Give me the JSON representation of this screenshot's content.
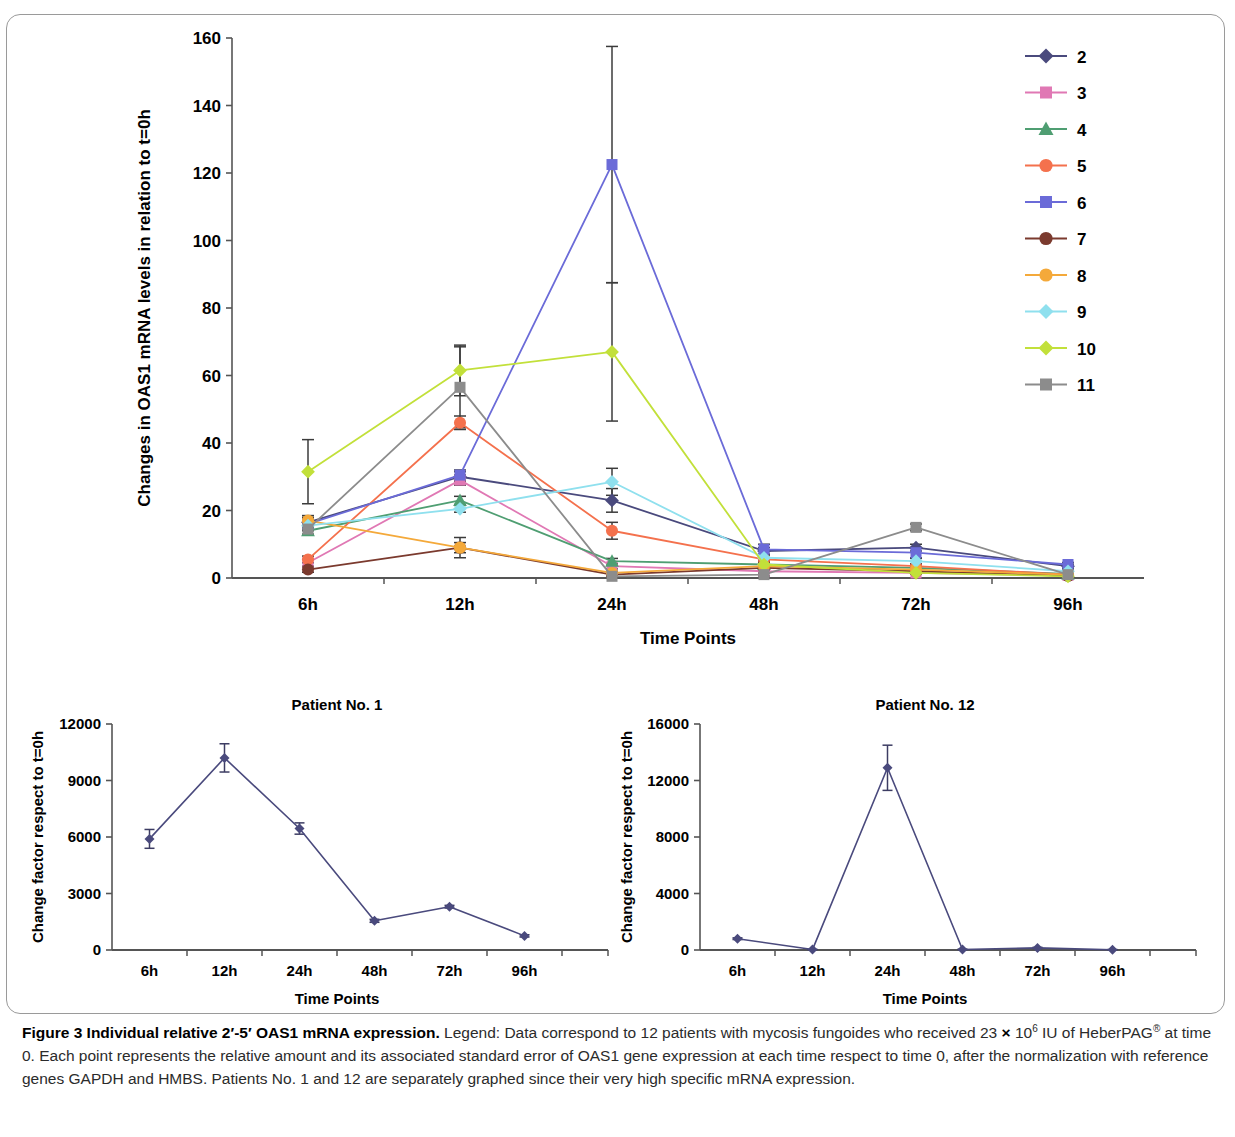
{
  "figure": {
    "caption_bold": "Figure 3 Individual relative 2′-5′ OAS1 mRNA expression.",
    "caption_rest_a": " Legend: Data correspond to 12 patients with mycosis fungoides who received 23 ",
    "caption_rest_b": " 10",
    "caption_exp": "6",
    "caption_rest_c": " IU of HeberPAG",
    "caption_reg": "®",
    "caption_rest_d": " at time 0. Each point represents the relative amount and its associated standard error of OAS1 gene expression at each time respect to time 0, after the normalization with reference genes GAPDH and HMBS. Patients No. 1 and 12 are separately graphed since their very high specific mRNA expression.",
    "times_symbol": "×"
  },
  "chart_data": [
    {
      "id": "main",
      "type": "line",
      "title": "",
      "xlabel": "Time Points",
      "ylabel": "Changes in OAS1 mRNA levels in relation to t=0h",
      "categories": [
        "6h",
        "12h",
        "24h",
        "48h",
        "72h",
        "96h"
      ],
      "ylim": [
        0,
        160
      ],
      "yticks": [
        0,
        20,
        40,
        60,
        80,
        100,
        120,
        140,
        160
      ],
      "grid": false,
      "legend_position": "right",
      "series": [
        {
          "name": "2",
          "color": "#4a4a7d",
          "marker": "diamond",
          "values": [
            16.5,
            30.0,
            23.0,
            8.0,
            9.0,
            3.5
          ],
          "errors": [
            1.5,
            1.5,
            3.5,
            1.0,
            1.0,
            0.6
          ]
        },
        {
          "name": "3",
          "color": "#e078b4",
          "marker": "square",
          "values": [
            4.5,
            29.0,
            3.5,
            2.0,
            1.5,
            0.8
          ],
          "errors": [
            1.0,
            1.5,
            0.8,
            0.5,
            0.4,
            0.3
          ]
        },
        {
          "name": "4",
          "color": "#4f9e72",
          "marker": "triangle",
          "values": [
            14.0,
            23.0,
            5.0,
            4.0,
            3.0,
            1.2
          ],
          "errors": [
            1.2,
            1.2,
            0.8,
            0.5,
            0.4,
            0.3
          ]
        },
        {
          "name": "5",
          "color": "#f4714d",
          "marker": "circle",
          "values": [
            5.5,
            46.0,
            14.0,
            5.5,
            3.5,
            1.0
          ],
          "errors": [
            1.0,
            2.0,
            2.5,
            0.6,
            0.5,
            0.3
          ]
        },
        {
          "name": "6",
          "color": "#6b6bd8",
          "marker": "square",
          "values": [
            16.0,
            30.5,
            122.5,
            8.5,
            7.5,
            4.0
          ],
          "errors": [
            1.5,
            1.5,
            35.0,
            1.5,
            1.5,
            0.6
          ]
        },
        {
          "name": "7",
          "color": "#7b3a2e",
          "marker": "circle",
          "values": [
            2.5,
            9.0,
            1.0,
            3.0,
            2.0,
            0.6
          ],
          "errors": [
            0.8,
            1.5,
            0.4,
            0.5,
            0.4,
            0.3
          ]
        },
        {
          "name": "8",
          "color": "#f4a93a",
          "marker": "circle",
          "values": [
            17.0,
            9.0,
            1.5,
            3.5,
            2.5,
            1.0
          ],
          "errors": [
            1.5,
            3.0,
            0.5,
            0.5,
            0.5,
            0.3
          ]
        },
        {
          "name": "9",
          "color": "#8fe0ee",
          "marker": "diamond",
          "values": [
            15.5,
            20.5,
            28.5,
            6.0,
            5.0,
            2.0
          ],
          "errors": [
            1.5,
            1.0,
            4.0,
            0.8,
            0.8,
            0.4
          ]
        },
        {
          "name": "10",
          "color": "#c2e03a",
          "marker": "diamond",
          "values": [
            31.5,
            61.5,
            67.0,
            4.0,
            1.5,
            0.5
          ],
          "errors": [
            9.5,
            7.5,
            20.5,
            0.8,
            0.4,
            0.3
          ]
        },
        {
          "name": "11",
          "color": "#8c8c8c",
          "marker": "square",
          "values": [
            14.5,
            56.5,
            0.5,
            1.0,
            15.0,
            1.0
          ],
          "errors": [
            1.5,
            12.0,
            0.4,
            0.4,
            1.0,
            0.3
          ]
        }
      ]
    },
    {
      "id": "patient1",
      "type": "line",
      "title": "Patient No. 1",
      "xlabel": "Time Points",
      "ylabel": "Change factor respect to t=0h",
      "categories": [
        "6h",
        "12h",
        "24h",
        "48h",
        "72h",
        "96h"
      ],
      "ylim": [
        0,
        12000
      ],
      "yticks": [
        0,
        3000,
        6000,
        9000,
        12000
      ],
      "grid": false,
      "series": [
        {
          "name": "Patient No. 1",
          "color": "#4a4a7d",
          "marker": "diamond",
          "values": [
            5900,
            10200,
            6450,
            1550,
            2300,
            750
          ],
          "errors": [
            500,
            750,
            300,
            80,
            70,
            60
          ]
        }
      ]
    },
    {
      "id": "patient12",
      "type": "line",
      "title": "Patient No. 12",
      "xlabel": "Time Points",
      "ylabel": "Change factor respect to t=0h",
      "categories": [
        "6h",
        "12h",
        "24h",
        "48h",
        "72h",
        "96h"
      ],
      "ylim": [
        0,
        16000
      ],
      "yticks": [
        0,
        4000,
        8000,
        12000,
        16000
      ],
      "grid": false,
      "series": [
        {
          "name": "Patient No. 12",
          "color": "#4a4a7d",
          "marker": "diamond",
          "values": [
            800,
            30,
            12900,
            40,
            150,
            20
          ],
          "errors": [
            60,
            20,
            1600,
            20,
            40,
            15
          ]
        }
      ]
    }
  ]
}
